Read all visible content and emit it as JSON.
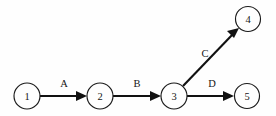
{
  "diagram": {
    "background_color": "#fefefe",
    "line_color": "#111111",
    "text_color": "#171717",
    "width": 276,
    "height": 116,
    "nodes": [
      {
        "id": "1",
        "label": "1",
        "cx": 27,
        "cy": 96,
        "r": 13
      },
      {
        "id": "2",
        "label": "2",
        "cx": 100,
        "cy": 96,
        "r": 13
      },
      {
        "id": "3",
        "label": "3",
        "cx": 174,
        "cy": 96,
        "r": 13
      },
      {
        "id": "4",
        "label": "4",
        "cx": 248,
        "cy": 19,
        "r": 12.5
      },
      {
        "id": "5",
        "label": "5",
        "cx": 247,
        "cy": 96,
        "r": 12.5
      }
    ],
    "edges": [
      {
        "id": "A",
        "label": "A",
        "from": "1",
        "to": "2",
        "x1": 40,
        "y1": 96,
        "x2": 87,
        "y2": 96,
        "label_x": 64,
        "label_y": 87
      },
      {
        "id": "B",
        "label": "B",
        "from": "2",
        "to": "3",
        "x1": 113,
        "y1": 96,
        "x2": 161,
        "y2": 96,
        "label_x": 137,
        "label_y": 87
      },
      {
        "id": "C",
        "label": "C",
        "from": "3",
        "to": "4",
        "x1": 183,
        "y1": 86,
        "x2": 239,
        "y2": 28,
        "label_x": 205,
        "label_y": 57
      },
      {
        "id": "D",
        "label": "D",
        "from": "3",
        "to": "5",
        "x1": 187,
        "y1": 96,
        "x2": 234,
        "y2": 96,
        "label_x": 212,
        "label_y": 87
      }
    ]
  }
}
